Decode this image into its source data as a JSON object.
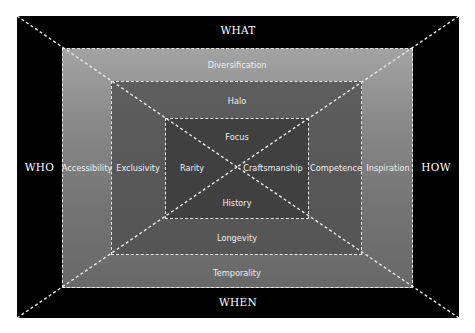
{
  "diagram": {
    "type": "nested-frame-diagram",
    "dimensions": {
      "top": "WHAT",
      "left": "WHO",
      "right": "HOW",
      "bottom": "WHEN"
    },
    "layers": {
      "outer": {
        "top": "Diversification",
        "left": "Accessibility",
        "right": "Inspiration",
        "bottom": "Temporality"
      },
      "middle": {
        "top": "Halo",
        "left": "Exclusivity",
        "right": "Competence",
        "bottom": "Longevity"
      },
      "inner": {
        "top": "Focus",
        "left": "Rarity",
        "right": "Craftsmanship",
        "bottom": "History"
      }
    },
    "colors": {
      "frame": "#000000",
      "outer_layer_top": "#a3a3a3",
      "outer_layer_bottom": "#686868",
      "middle_layer": "#585858",
      "inner_layer": "#404040",
      "dash_lines": "#e8e8e8",
      "text": "#ffffff"
    }
  }
}
